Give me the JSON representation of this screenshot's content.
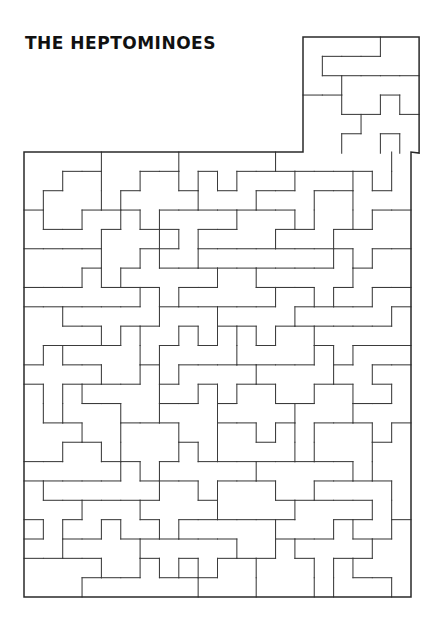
{
  "title": "THE HEPTOMINOES",
  "colors": {
    "background": "#ffffff",
    "title_color": "#111111",
    "piece_outline": "#3b3b3b",
    "board_outline": "#2a2a2a",
    "piece_fill": "#ffffff"
  },
  "figure": {
    "name": "heptomino-tiling-puzzle",
    "cell_size": 19.35,
    "board": {
      "main_region": {
        "x": 24,
        "y": 152,
        "cols": 20,
        "rows": 23
      },
      "top_region": {
        "x": 303,
        "y": 37,
        "cols": 6,
        "rows": 6
      }
    },
    "piece_count": 128,
    "cells_per_piece": 7
  },
  "chart_data": {
    "type": "table",
    "title": "THE HEPTOMINOES",
    "xlabel": "",
    "ylabel": "",
    "grid": true,
    "legend_position": "none",
    "regions": [
      {
        "label": "upper-block",
        "cols": 6,
        "rows": 6,
        "cells": 36
      },
      {
        "label": "main-block",
        "cols": 20,
        "rows": 23,
        "cells": 460
      }
    ],
    "categories": [
      "upper-block",
      "main-block"
    ],
    "values": [
      36,
      460
    ]
  },
  "pieces": {
    "comment": "Each entry is a list of [col,row] unit cells in board coordinates; board origin is the top-left of the upper block column space.",
    "upper": [
      [
        [
          0,
          0
        ],
        [
          1,
          0
        ],
        [
          2,
          0
        ],
        [
          0,
          1
        ],
        [
          0,
          2
        ],
        [
          0,
          3
        ],
        [
          0,
          4
        ]
      ],
      [
        [
          3,
          0
        ],
        [
          4,
          0
        ],
        [
          5,
          0
        ],
        [
          5,
          1
        ],
        [
          5,
          2
        ],
        [
          4,
          1
        ],
        [
          3,
          1
        ]
      ],
      [
        [
          1,
          1
        ],
        [
          2,
          1
        ],
        [
          2,
          2
        ],
        [
          2,
          3
        ],
        [
          1,
          2
        ],
        [
          1,
          3
        ],
        [
          1,
          4
        ]
      ],
      [
        [
          3,
          2
        ],
        [
          4,
          2
        ],
        [
          3,
          3
        ],
        [
          4,
          3
        ],
        [
          5,
          3
        ],
        [
          3,
          4
        ],
        [
          4,
          4
        ]
      ],
      [
        [
          0,
          5
        ],
        [
          1,
          5
        ],
        [
          2,
          5
        ],
        [
          3,
          5
        ],
        [
          4,
          5
        ],
        [
          5,
          5
        ],
        [
          5,
          4
        ]
      ]
    ],
    "main_rows": 23,
    "main_cols": 20
  }
}
